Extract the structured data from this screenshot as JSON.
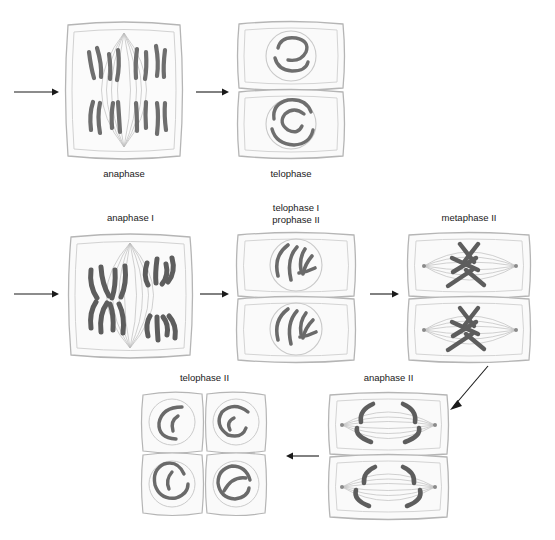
{
  "figure": {
    "style": "pencil-sketch biology illustration",
    "background_color": "#ffffff",
    "chromosome_color": "#6b6b6b",
    "chromosome_dark_color": "#555555",
    "outline_color": "#b9b9b9",
    "cell_fill_color": "#fafafa",
    "arrow_color": "#1a1a1a",
    "label_color": "#1a1a1a"
  },
  "rows": [
    {
      "name": "mitosis-row",
      "stages": [
        {
          "id": "anaphase",
          "label": "anaphase",
          "cell_type": "single-cell-spindle",
          "chromosome_count": 8,
          "description": "V-shaped chromosomes migrating to opposite poles on a vertical spindle"
        },
        {
          "id": "telophase",
          "label": "telophase",
          "cell_type": "two-cell-stacked",
          "chromosome_count": 2,
          "description": "two daughter cells each with a reforming nucleus containing tangled chromatin"
        }
      ]
    },
    {
      "name": "meiosis-one-row",
      "stages": [
        {
          "id": "anaphase-1",
          "label": "anaphase I",
          "cell_type": "single-cell-spindle",
          "chromosome_count": 4,
          "description": "paired sister chromatids moving to opposite poles"
        },
        {
          "id": "telophase-1-prophase-2",
          "label": "telophase I\nprophase II",
          "cell_type": "two-cell-stacked",
          "chromosome_count": 4,
          "description": "two daughter cells with nuclei containing curved chromosomes"
        },
        {
          "id": "metaphase-2",
          "label": "metaphase II",
          "cell_type": "two-cell-stacked-horizontal-spindle",
          "chromosome_count": 4,
          "description": "two cells with horizontal spindles and X-shaped chromosomes at the metaphase plate"
        }
      ]
    },
    {
      "name": "meiosis-two-row",
      "stages": [
        {
          "id": "telophase-2",
          "label": "telophase II",
          "cell_type": "four-cell-grid",
          "chromosome_count": 2,
          "description": "four haploid daughter cells in a 2x2 grid, each with a nucleus"
        },
        {
          "id": "anaphase-2",
          "label": "anaphase II",
          "cell_type": "two-cell-stacked-horizontal-spindle",
          "chromosome_count": 4,
          "description": "chromatids separating toward opposite poles on horizontal spindles"
        }
      ]
    }
  ],
  "arrows": [
    {
      "id": "arrow-into-anaphase",
      "direction": "right",
      "from": "",
      "to": "anaphase"
    },
    {
      "id": "arrow-anaphase-to-telophase",
      "direction": "right",
      "from": "anaphase",
      "to": "telophase"
    },
    {
      "id": "arrow-into-anaphase-1",
      "direction": "right",
      "from": "",
      "to": "anaphase I"
    },
    {
      "id": "arrow-anaphase1-to-telophase1",
      "direction": "right",
      "from": "anaphase I",
      "to": "telophase I prophase II"
    },
    {
      "id": "arrow-telophase1-to-metaphase2",
      "direction": "right",
      "from": "telophase I prophase II",
      "to": "metaphase II"
    },
    {
      "id": "arrow-metaphase2-to-anaphase2",
      "direction": "diagonal-down-left",
      "from": "metaphase II",
      "to": "anaphase II"
    },
    {
      "id": "arrow-anaphase2-to-telophase2",
      "direction": "left",
      "from": "anaphase II",
      "to": "telophase II"
    }
  ]
}
